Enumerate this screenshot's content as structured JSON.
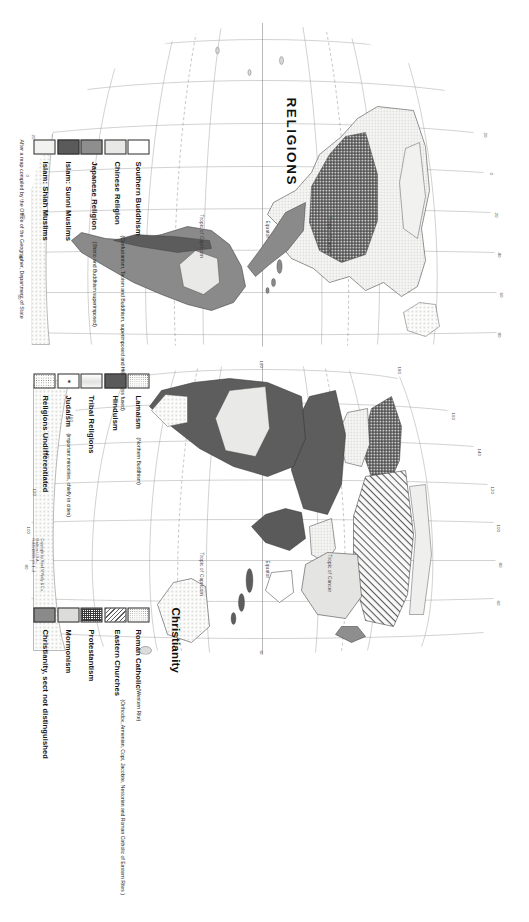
{
  "map": {
    "title": "RELIGIONS",
    "copyright_lines": [
      "Copyright by Rand MªNally & Co.",
      "Made in U.S.A.",
      "R-8251000B-VX-1--2"
    ],
    "footer": "After a map compiled by the Office of the Geographer, Department of State",
    "reference_lines": [
      "Tropic of Cancer",
      "Equator",
      "Tropic of Capricorn"
    ],
    "graticule_labels": [
      "20",
      "0",
      "20",
      "40",
      "60",
      "80",
      "100 W",
      "120",
      "140",
      "160",
      "180",
      "160",
      "140",
      "120",
      "100",
      "80",
      "60",
      "40",
      "20"
    ],
    "accent_colors": {
      "ink": "#1a1a1a",
      "line": "#4a4a4a",
      "paper": "#ffffff",
      "dark_fill": "#5a5a5a",
      "mid_fill": "#8e8e8e",
      "light_fill": "#e8e8e6"
    }
  },
  "legend": {
    "column_a": {
      "heading": "",
      "items": [
        {
          "label": "Southern Buddhism",
          "sub": "",
          "swatch": "plain"
        },
        {
          "label": "Chinese Religion",
          "sub": "(Confucianism, Taoism and Buddhism, superimposed and more or less fused)",
          "swatch": "light"
        },
        {
          "label": "Japanese Religion",
          "sub": "(Shinto and Buddhism superimposed)",
          "swatch": "mgrey"
        },
        {
          "label": "Islam: Sunni Muslims",
          "sub": "",
          "swatch": "dgrey"
        },
        {
          "label": "Islam: Shiah Muslims",
          "sub": "",
          "swatch": "vlight"
        }
      ]
    },
    "column_b": {
      "heading": "",
      "items": [
        {
          "label": "Lamaism",
          "sub": "(Northern Buddhism)",
          "swatch": "dots"
        },
        {
          "label": "Hinduism",
          "sub": "",
          "swatch": "dgrey"
        },
        {
          "label": "Tribal Religions",
          "sub": "",
          "swatch": "grad"
        },
        {
          "label": "Judaism",
          "sub": "(important minorities, chiefly in cities)",
          "swatch": "star"
        },
        {
          "label": "Religions Undifferentiated",
          "sub": "",
          "swatch": "dots2"
        }
      ]
    },
    "column_c": {
      "heading": "Christianity",
      "items": [
        {
          "label": "Roman Catholic",
          "sub": "(Western Rite)",
          "swatch": "dots"
        },
        {
          "label": "Eastern Churches",
          "sub": "(Orthodox, Armenian, Copt, Jacobite, Nestorian and Roman Catholic of Eastern Rites )",
          "swatch": "diag"
        },
        {
          "label": "Protestantism",
          "sub": "",
          "swatch": "check"
        },
        {
          "label": "Mormonism",
          "sub": "",
          "swatch": "lgrey"
        },
        {
          "label": "Christianity, sect not distinguished",
          "sub": "",
          "swatch": "mgrey2"
        }
      ]
    }
  }
}
